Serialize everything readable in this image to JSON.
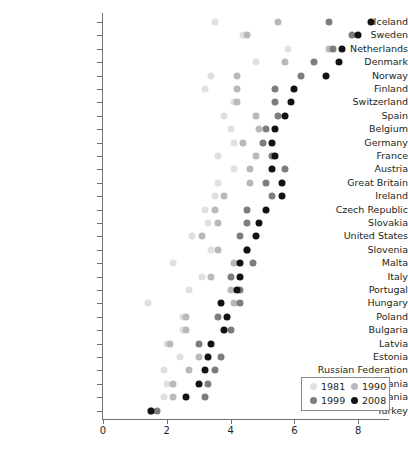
{
  "chart_data": {
    "type": "scatter",
    "title": "",
    "xlabel": "",
    "ylabel": "",
    "xlim": [
      0,
      9
    ],
    "xticks": [
      0,
      2,
      4,
      6,
      8
    ],
    "xtick_labels": [
      "0",
      "2",
      "4",
      "6",
      "8"
    ],
    "grid": false,
    "legend_position": "bottom-right",
    "legend_entries": [
      {
        "name": "1981",
        "color": "#e0e0e0"
      },
      {
        "name": "1990",
        "color": "#b9b9b9"
      },
      {
        "name": "1999",
        "color": "#7d7d7d"
      },
      {
        "name": "2008",
        "color": "#121212"
      }
    ],
    "series_colors": {
      "1981": "#e0e0e0",
      "1990": "#b9b9b9",
      "1999": "#7d7d7d",
      "2008": "#121212"
    },
    "categories": [
      "Iceland",
      "Sweden",
      "Netherlands",
      "Denmark",
      "Norway",
      "Finland",
      "Switzerland",
      "Spain",
      "Belgium",
      "Germany",
      "France",
      "Austria",
      "Great Britain",
      "Ireland",
      "Czech Republic",
      "Slovakia",
      "United States",
      "Slovenia",
      "Malta",
      "Italy",
      "Portugal",
      "Hungary",
      "Poland",
      "Bulgaria",
      "Latvia",
      "Estonia",
      "Russian Federation",
      "Romania",
      "Lithuania",
      "Turkey"
    ],
    "series": [
      {
        "name": "1981",
        "values": [
          3.5,
          4.4,
          5.8,
          4.8,
          3.4,
          3.2,
          4.1,
          3.8,
          4.0,
          4.1,
          3.6,
          4.1,
          3.6,
          3.5,
          3.2,
          3.3,
          2.8,
          3.4,
          2.2,
          3.1,
          2.7,
          1.4,
          2.5,
          2.5,
          2.0,
          2.4,
          1.9,
          2.0,
          1.9,
          1.5
        ]
      },
      {
        "name": "1990",
        "values": [
          5.5,
          4.5,
          7.1,
          5.7,
          4.2,
          4.2,
          4.2,
          4.8,
          4.9,
          4.4,
          4.8,
          4.6,
          4.6,
          3.8,
          3.5,
          3.6,
          3.1,
          3.6,
          4.1,
          3.4,
          4.0,
          4.1,
          2.6,
          2.6,
          2.1,
          3.0,
          2.7,
          2.2,
          2.2,
          1.5
        ]
      },
      {
        "name": "1999",
        "values": [
          7.1,
          7.8,
          7.2,
          6.6,
          6.2,
          5.4,
          5.4,
          5.5,
          5.1,
          5.0,
          5.3,
          5.7,
          5.1,
          5.3,
          4.5,
          4.5,
          4.3,
          4.5,
          4.7,
          4.0,
          4.3,
          4.3,
          3.6,
          4.0,
          3.0,
          3.7,
          3.5,
          3.3,
          3.2,
          1.7
        ]
      },
      {
        "name": "2008",
        "values": [
          8.4,
          8.0,
          7.5,
          7.4,
          7.0,
          6.0,
          5.9,
          5.7,
          5.4,
          5.3,
          5.4,
          5.3,
          5.6,
          5.6,
          5.1,
          4.9,
          4.8,
          4.5,
          4.3,
          4.3,
          4.2,
          3.7,
          3.9,
          3.8,
          3.4,
          3.3,
          3.2,
          3.0,
          2.6,
          1.5
        ]
      }
    ]
  }
}
